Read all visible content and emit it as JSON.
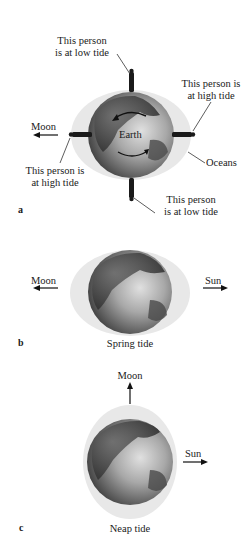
{
  "panels": {
    "a": {
      "letter": "a",
      "earth_label": "Earth",
      "moon_label": "Moon",
      "oceans_label": "Oceans",
      "top_person": {
        "line1": "This person",
        "line2": "is at low tide"
      },
      "right_person": {
        "line1": "This person is",
        "line2": "at high tide"
      },
      "left_person": {
        "line1": "This person is",
        "line2": "at high tide"
      },
      "bottom_person": {
        "line1": "This person",
        "line2": "is at low tide"
      }
    },
    "b": {
      "letter": "b",
      "moon_label": "Moon",
      "sun_label": "Sun",
      "caption": "Spring tide"
    },
    "c": {
      "letter": "c",
      "moon_label": "Moon",
      "sun_label": "Sun",
      "caption": "Neap tide"
    }
  },
  "colors": {
    "ocean_bulge": "#e6e6e6",
    "globe_dark": "#3a3a3a",
    "globe_light": "#c8c8c8",
    "text": "#1a1a1a"
  }
}
